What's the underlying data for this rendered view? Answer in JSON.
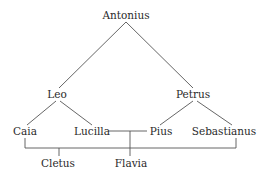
{
  "diagram": {
    "type": "family-tree",
    "nodes": {
      "antonius": "Antonius",
      "leo": "Leo",
      "petrus": "Petrus",
      "caia": "Caia",
      "lucilla": "Lucilla",
      "pius": "Pius",
      "sebastianus": "Sebastianus",
      "cletus": "Cletus",
      "flavia": "Flavia"
    },
    "edges": [
      {
        "from": "Antonius",
        "to": "Leo",
        "relation": "parent-child"
      },
      {
        "from": "Antonius",
        "to": "Petrus",
        "relation": "parent-child"
      },
      {
        "from": "Leo",
        "to": "Caia",
        "relation": "parent-child"
      },
      {
        "from": "Leo",
        "to": "Lucilla",
        "relation": "parent-child"
      },
      {
        "from": "Petrus",
        "to": "Pius",
        "relation": "parent-child"
      },
      {
        "from": "Petrus",
        "to": "Sebastianus",
        "relation": "parent-child"
      },
      {
        "from": "Lucilla",
        "to": "Pius",
        "relation": "marriage"
      },
      {
        "from": "Lucilla+Pius",
        "to": "Flavia",
        "relation": "parent-child"
      },
      {
        "from": "Caia",
        "to": "Sebastianus",
        "relation": "marriage"
      },
      {
        "from": "Caia+Sebastianus",
        "to": "Cletus",
        "relation": "parent-child"
      }
    ]
  }
}
